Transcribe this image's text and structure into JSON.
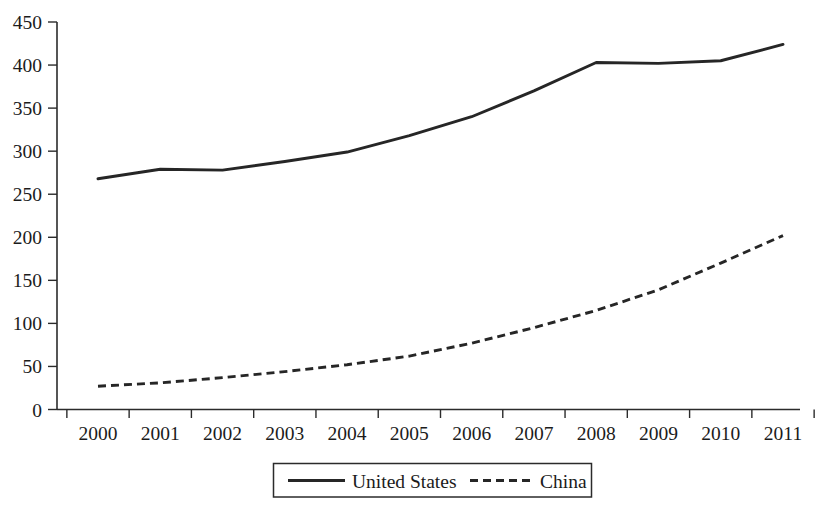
{
  "chart_data": {
    "type": "line",
    "title": "",
    "subtitle": "",
    "xlabel": "",
    "ylabel": "",
    "categories": [
      "2000",
      "2001",
      "2002",
      "2003",
      "2004",
      "2005",
      "2006",
      "2007",
      "2008",
      "2009",
      "2010",
      "2011"
    ],
    "series": [
      {
        "name": "United States",
        "style": "solid",
        "color": "#262626",
        "values": [
          268,
          279,
          278,
          288,
          299,
          318,
          340,
          370,
          403,
          402,
          405,
          424
        ]
      },
      {
        "name": "China",
        "style": "dashed",
        "color": "#262626",
        "values": [
          27,
          31,
          37,
          44,
          52,
          62,
          77,
          95,
          115,
          139,
          170,
          202
        ]
      }
    ],
    "ylim": [
      0,
      450
    ],
    "ytick_values": [
      0,
      50,
      100,
      150,
      200,
      250,
      300,
      350,
      400,
      450
    ],
    "ytick_labels": [
      "0",
      "50",
      "100",
      "150",
      "200",
      "250",
      "300",
      "350",
      "400",
      "450"
    ],
    "grid": false,
    "legend_position": "bottom-center",
    "legend_entries": [
      "United States",
      "China"
    ]
  },
  "axes": {
    "y_labels": [
      "450",
      "400",
      "350",
      "300",
      "250",
      "200",
      "150",
      "100",
      "50",
      "0"
    ],
    "x_labels": [
      "2000",
      "2001",
      "2002",
      "2003",
      "2004",
      "2005",
      "2006",
      "2007",
      "2008",
      "2009",
      "2010",
      "2011"
    ]
  },
  "legend": {
    "items": [
      {
        "label": "United States",
        "style": "solid"
      },
      {
        "label": "China",
        "style": "dashed"
      }
    ]
  },
  "colors": {
    "line": "#262626",
    "axis": "#2b2b2b",
    "text": "#1b1b1b",
    "background": "#ffffff"
  }
}
